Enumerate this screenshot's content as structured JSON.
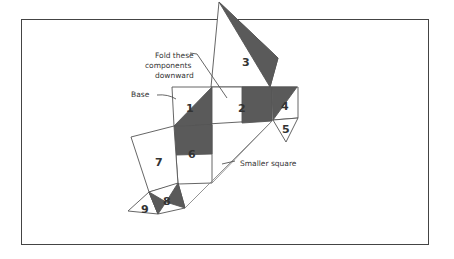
{
  "diagram": {
    "labels": {
      "fold": [
        "Fold these",
        "components",
        "downward"
      ],
      "base": "Base",
      "smaller_square": "Smaller square"
    },
    "components": [
      "1",
      "2",
      "3",
      "4",
      "5",
      "6",
      "7",
      "8",
      "9"
    ],
    "colors": {
      "dark_fill": "#5a5a5a",
      "stroke": "#555555",
      "frame": "#444444"
    }
  }
}
